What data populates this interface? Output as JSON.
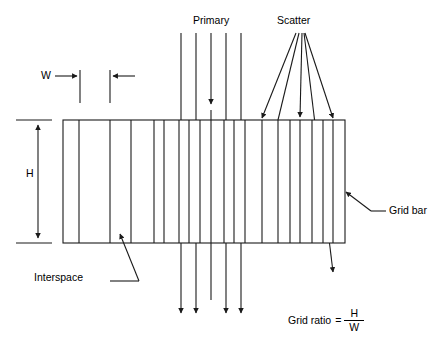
{
  "diagram": {
    "title_semantic": "anti-scatter-grid-cross-section",
    "labels": {
      "primary": "Primary",
      "scatter": "Scatter",
      "w": "W",
      "h": "H",
      "interspace": "Interspace",
      "grid_bar": "Grid bar"
    },
    "formula": {
      "lhs": "Grid ratio",
      "equals": "=",
      "numerator": "H",
      "denominator": "W"
    },
    "colors": {
      "stroke": "#1a1a1a",
      "background": "#ffffff"
    },
    "geometry": {
      "grid_rect": {
        "x": 63,
        "y": 120,
        "width": 282,
        "height": 123
      },
      "grid_bar_x_positions": [
        63,
        79,
        110,
        131,
        154,
        164,
        179,
        189,
        200,
        211,
        224,
        234,
        245,
        262,
        278,
        290,
        300,
        312,
        323,
        333,
        345
      ],
      "h_dimension": {
        "x": 38,
        "top": 120,
        "bottom": 243
      },
      "w_dimension": {
        "tick_left_x": 80,
        "tick_right_x": 110,
        "top": 70,
        "bottom": 103
      },
      "primary_rays_x": [
        181,
        196,
        211,
        226,
        241
      ],
      "primary_ray_top": 33,
      "primary_ray_bottom": 318,
      "scatter_origin": {
        "x": 300,
        "y": 33
      }
    }
  }
}
